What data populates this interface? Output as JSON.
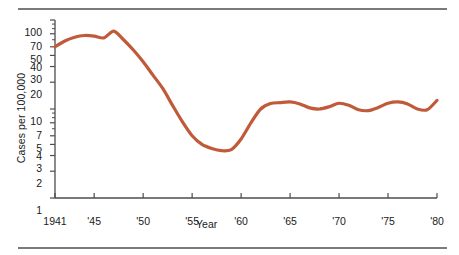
{
  "chart_data": {
    "type": "line",
    "title": "",
    "xlabel": "Year",
    "ylabel": "Cases per 100,000",
    "yscale": "log",
    "ylim": [
      1,
      100
    ],
    "xlim": [
      1941,
      1980
    ],
    "grid": false,
    "legend": null,
    "line_color": "#c05a38",
    "axis_color": "#4d4d4d",
    "ytick_labels": [
      "100",
      "70",
      "50",
      "40",
      "30",
      "20",
      "10",
      "7",
      "5",
      "4",
      "3",
      "2",
      "1"
    ],
    "ytick_values": [
      100,
      70,
      50,
      40,
      30,
      20,
      10,
      7,
      5,
      4,
      3,
      2,
      1
    ],
    "xtick_labels": [
      "1941",
      "'45",
      "'50",
      "'55",
      "'60",
      "'65",
      "'70",
      "'75",
      "'80"
    ],
    "xtick_values": [
      1941,
      1945,
      1950,
      1955,
      1960,
      1965,
      1970,
      1975,
      1980
    ],
    "series": [
      {
        "name": "Cases per 100,000",
        "x": [
          1941,
          1942,
          1943,
          1944,
          1945,
          1946,
          1947,
          1948,
          1949,
          1950,
          1951,
          1952,
          1953,
          1954,
          1955,
          1956,
          1957,
          1958,
          1959,
          1960,
          1961,
          1962,
          1963,
          1964,
          1965,
          1966,
          1967,
          1968,
          1969,
          1970,
          1971,
          1972,
          1973,
          1974,
          1975,
          1976,
          1977,
          1978,
          1979,
          1980
        ],
        "values": [
          50,
          58,
          64,
          67,
          66,
          63,
          75,
          60,
          46,
          34,
          24,
          17,
          11,
          7.2,
          5.0,
          4.0,
          3.6,
          3.4,
          3.5,
          4.6,
          7.0,
          10.0,
          11.5,
          11.8,
          12.0,
          11.4,
          10.3,
          10.0,
          10.6,
          11.6,
          11.0,
          9.8,
          9.6,
          10.4,
          11.6,
          12.0,
          11.4,
          10.0,
          9.8,
          12.5
        ]
      }
    ]
  }
}
